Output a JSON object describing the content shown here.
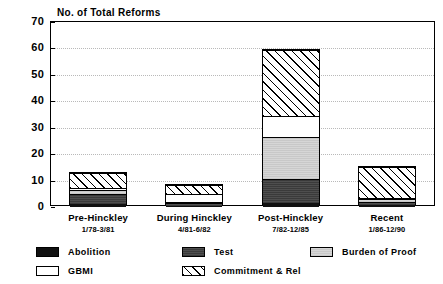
{
  "chart_data": {
    "type": "bar",
    "title": "No. of Total Reforms",
    "xlabel": "",
    "ylabel": "",
    "ylim": [
      0,
      70
    ],
    "ytick_step": 10,
    "yticks": [
      0,
      10,
      20,
      30,
      40,
      50,
      60,
      70
    ],
    "grid": true,
    "stacked": true,
    "legend_position": "bottom",
    "categories": [
      "Pre-Hinckley",
      "During Hinckley",
      "Post-Hinckley",
      "Recent"
    ],
    "category_ranges": [
      "1/78-3/81",
      "4/81-6/82",
      "7/82-12/85",
      "1/86-12/90"
    ],
    "series": [
      {
        "name": "Abolition",
        "values": [
          1,
          0.3,
          1.5,
          0.8
        ]
      },
      {
        "name": "Test",
        "values": [
          4,
          1.2,
          9,
          1.2
        ]
      },
      {
        "name": "Burden of Proof",
        "values": [
          1.5,
          0.5,
          16,
          1
        ]
      },
      {
        "name": "GBMI",
        "values": [
          0.5,
          3,
          8,
          0.5
        ]
      },
      {
        "name": "Commitment & Rel",
        "values": [
          6,
          3.5,
          25,
          11.5
        ]
      }
    ],
    "totals": [
      13,
      8.5,
      59.5,
      15
    ]
  },
  "yticks": [
    {
      "label": "70",
      "value": 70
    },
    {
      "label": "60",
      "value": 60
    },
    {
      "label": "50",
      "value": 50
    },
    {
      "label": "40",
      "value": 40
    },
    {
      "label": "30",
      "value": 30
    },
    {
      "label": "20",
      "value": 20
    },
    {
      "label": "10",
      "value": 10
    },
    {
      "label": "0",
      "value": 0
    }
  ],
  "legend": {
    "items": [
      {
        "label": "Abolition",
        "swatch": "abolition-swatch",
        "color": "#111111"
      },
      {
        "label": "Test",
        "swatch": "test-swatch",
        "color": "#434343"
      },
      {
        "label": "Burden of Proof",
        "swatch": "burden-of-proof-swatch",
        "color": "#cfcfcf"
      },
      {
        "label": "GBMI",
        "swatch": "gbmi-swatch",
        "color": "#ffffff"
      },
      {
        "label": "Commitment & Rel",
        "swatch": "commitment-and-rel-swatch",
        "color": "#ffffff"
      }
    ]
  }
}
